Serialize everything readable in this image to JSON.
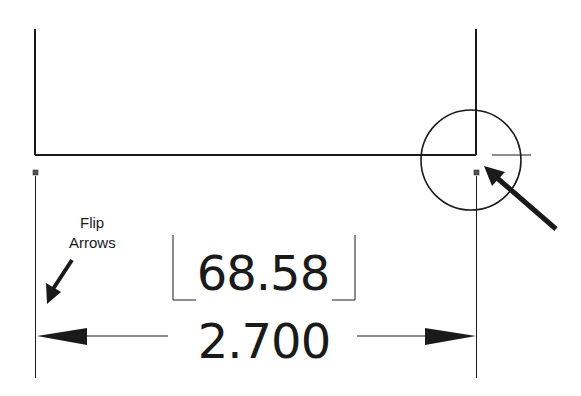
{
  "drawing": {
    "primary_dimension": "2.700",
    "alternate_dimension": "68.58",
    "annotation": {
      "line1": "Flip",
      "line2": "Arrows"
    },
    "colors": {
      "line": "#1a1a1a",
      "background": "#ffffff",
      "marker": "#555555"
    }
  }
}
